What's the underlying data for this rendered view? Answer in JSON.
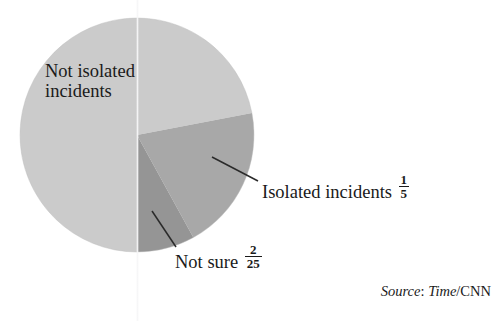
{
  "chart_data": {
    "type": "pie",
    "title": "",
    "subtitle": "",
    "xlabel": "",
    "ylabel": "",
    "grid": false,
    "legend_position": "none",
    "labels_on_chart": true,
    "source": "Source: Time/CNN",
    "slices": [
      {
        "name": "not-isolated-incidents",
        "label_line1": "Not isolated",
        "label_line2": "incidents",
        "value_fraction": "18/25",
        "value_numerator": "",
        "value_denominator": "",
        "value_decimal": 0.72,
        "percent": 72,
        "color": "#cbcbcb",
        "label_shown_inside": true,
        "fraction_shown": false
      },
      {
        "name": "isolated-incidents",
        "label_line1": "Isolated incidents",
        "label_line2": "",
        "value_fraction": "1/5",
        "value_numerator": "1",
        "value_denominator": "5",
        "value_decimal": 0.2,
        "percent": 20,
        "color": "#a8a8a8",
        "label_shown_inside": false,
        "fraction_shown": true
      },
      {
        "name": "not-sure",
        "label_line1": "Not sure",
        "label_line2": "",
        "value_fraction": "2/25",
        "value_numerator": "2",
        "value_denominator": "25",
        "value_decimal": 0.08,
        "percent": 8,
        "color": "#959595",
        "label_shown_inside": false,
        "fraction_shown": true
      }
    ],
    "geometry": {
      "center_x": 137,
      "center_y": 135,
      "radius": 117,
      "start_angle_deg_from_12oclock": 180,
      "direction": "counterclockwise"
    }
  },
  "source": {
    "prefix": "Source",
    "colon": ": ",
    "publication": "Time",
    "suffix": "/CNN",
    "full": "Source: Time/CNN"
  },
  "annotations": {
    "leader_isolated": "leader-line-isolated-incidents",
    "leader_not_sure": "leader-line-not-sure"
  }
}
